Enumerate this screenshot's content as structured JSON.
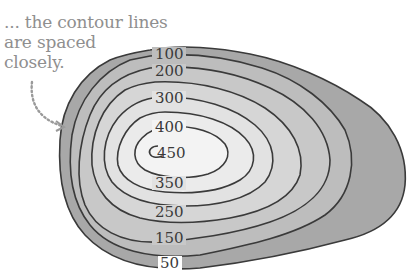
{
  "caption": {
    "lines": [
      "... the contour lines",
      "are spaced",
      "closely."
    ]
  },
  "contour_labels": {
    "l100": "100",
    "l200": "200",
    "l300": "300",
    "l400": "400",
    "l450": "450",
    "l350": "350",
    "l250": "250",
    "l150": "150",
    "l50": "50"
  },
  "colors": {
    "outer_fill": "#a8a8a8",
    "mid_fill": "#c4c4c4",
    "inner_fill": "#dcdcdc",
    "center_fill": "#efefef",
    "line": "#3a3a3a",
    "caption_text": "#8f8f8f"
  }
}
